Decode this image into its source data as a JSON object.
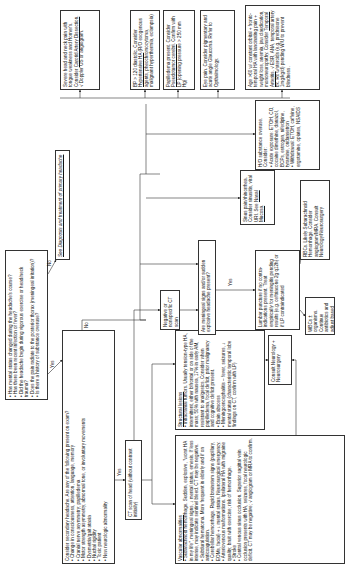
{
  "flowchart": {
    "q1": {
      "items": [
        "Has mental status changed during the headache's course?",
        "Has there been recent infection or fever?",
        "Did the headache begin during vigorous exercise or head/neck trauma?",
        "Does the pain radiate to the posterior thorax (meningeal irritation)?",
        "Is there a history of substance overuse?"
      ]
    },
    "labels": {
      "yes": "Yes",
      "no": "No"
    },
    "primary": {
      "text": "See Diagnosis and treatment of primary headache"
    },
    "secondary": {
      "title": "Consider secondary headache. Are any of the following present on exam?",
      "items": [
        "Change in consciousness, attention, language, memory",
        "Cranial nerve asymmetry; papilledema",
        "Motor strength asymmetry, abnormal tone, or involuntary movements",
        "Dysmetria/gait ataxia",
        "Nuchal rigidity",
        "Toxic patient",
        "New neurologic abnormality"
      ]
    },
    "ct": {
      "text": "CT scan of head (without contrast initially)"
    },
    "vascular": {
      "title": "Vascular abnormalities",
      "items": [
        "Subarachnoid hemorrhage. Sudden, explosive, \"worst HA in my life\", meningeal signs, ↓ mental status, emesis. If less intense, may indicate sentinel bleed. CT may be negative.",
        "Subdural hematoma. More frequent in elderly and if on anticoagulation.",
        "Cerebellar hemorrhage. Rapid brainstem signs (pupillary, EOMs, facial) + ↓ mental status. Neurosurgical emergency.",
        "Arteriovenous malformations. Ipsilateral HA with migraine quality; bruit with exercise; risk of hemorrhage.",
        "Stroke",
        "Central venous sinus occlusion. Superior sagittal vein occlusion presents with HA, seizures, focal neurologic deficit. CT may be negative; √ angiogram or MRA to confirm."
      ]
    },
    "structural": {
      "title": "Structural lesions",
      "items": [
        "Intracranial tumors. Usually tension-type HA, intermittent, either bifrontal or on side of the mass; 50% with nausea, 17% in early AM, resistant to analgesics. Consider when papilledema, focal deficit, prior malignancy and cognitive deficit present.",
        "Brain abscess",
        "Meningoencephalitis – fever, seizures, ↓ mental status (characteristic temporal lobe findings on CT, confirm with LP)"
      ]
    },
    "consult": {
      "text": "Consult Neurology + Neurosurgery"
    },
    "negative_ct": {
      "text": "Negative or nonspecific CT scan"
    },
    "meningeal": {
      "text": "Are meningeal signs and/or sudden explosive headache present?"
    },
    "lp": {
      "text": "Lumbar puncture if no contra-indications present. Treat empirically for meningitis pending results (e.g. ceftriaxone 2g q12h) or if LP contraindicated"
    },
    "wbc": {
      "text": "WBCs ± organisms. Continue antibiotics and adjust based on C+S"
    },
    "rbc": {
      "text": "RBCs. Likely Subarachnoid Hemorrhage. Consider angiogram/MRA. Consult Neurology/Neurosurgery"
    },
    "sinus": {
      "text_a": "Sinus pain/rhinorrhea. Consider sinusitis, viral URI. See ",
      "link": "Nasal Mucosa",
      "text_b": "."
    },
    "substance": {
      "title": "H/O substance overuse. Consider:",
      "items": [
        "Acute exposure: ETOH, CO, cocaine dimethine, danazol, BCPs, estrogen, nifedipine, tyramine, ondansetron",
        "Withdrawal: ETOH, caffeine, ergotamine, opiates, NSAIDS"
      ]
    },
    "severe": {
      "text_a": "Severe head and neck pain with tongue weakness and Horner's. Consider ",
      "link": "Carotid Artery Dissection",
      "text_b": ". √ Doppler US or angiogram."
    },
    "bp": {
      "text_a": "BP > 120 diastolic. Consider ",
      "link": "Hypertensive HA",
      "text_b": " (R/O exogenous agents, pheochromocytoma, malignant hyperthermia, eclampsia)"
    },
    "papilledema": {
      "text_a": "Papilledema present. Consider ",
      "link": "Pseudotumor cerebri",
      "text_b": ". Confirm with LP (opening pressure > 250 mm Hg)"
    },
    "eye": {
      "text": "Eye pain. Consider pigmentary and acute angle Glaucoma. Refer to Opthalmology."
    },
    "age": {
      "text_a": "Age >60 w/ constant orbital + fronto-temporal HA with lancinating pain + weight loss, anemia, jaw claudication, mononeuropathy. Consider ",
      "link": "Temporal Arteritis",
      "text_b": ". √ ESR, ANA, temporal artery bx. Rx w/steroids (e.g. prednisone 1mg/kg/d) pending W/U to prevent blindness."
    }
  }
}
